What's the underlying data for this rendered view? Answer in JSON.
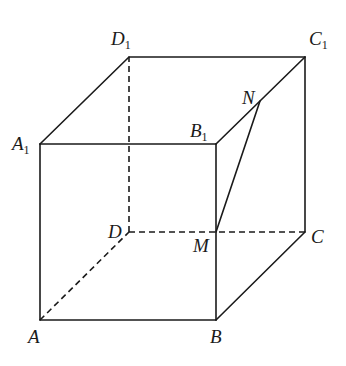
{
  "figure": {
    "type": "cube-perspective",
    "stroke_color": "#1a1a1a",
    "background": "#ffffff"
  },
  "vertices": {
    "A": {
      "name": "A",
      "sub": "",
      "x": 40,
      "y": 320
    },
    "B": {
      "name": "B",
      "sub": "",
      "x": 216,
      "y": 320
    },
    "C": {
      "name": "C",
      "sub": "",
      "x": 305,
      "y": 232
    },
    "D": {
      "name": "D",
      "sub": "",
      "x": 129,
      "y": 232
    },
    "A1": {
      "name": "A",
      "sub": "1",
      "x": 40,
      "y": 144
    },
    "B1": {
      "name": "B",
      "sub": "1",
      "x": 216,
      "y": 144
    },
    "C1": {
      "name": "C",
      "sub": "1",
      "x": 305,
      "y": 57
    },
    "D1": {
      "name": "D",
      "sub": "1",
      "x": 129,
      "y": 57
    },
    "M": {
      "name": "M",
      "sub": "",
      "x": 216,
      "y": 232
    },
    "N": {
      "name": "N",
      "sub": "",
      "x": 260,
      "y": 101
    }
  },
  "edges": {
    "solid": [
      "A-B",
      "B-C",
      "C-C1",
      "C1-D1",
      "D1-A1",
      "A1-A",
      "A1-B1",
      "B1-C1",
      "B1-B",
      "M-N"
    ],
    "dashed": [
      "A-D",
      "D-C",
      "D-D1"
    ]
  },
  "labels": {
    "A": {
      "text": "A",
      "sub": ""
    },
    "B": {
      "text": "B",
      "sub": ""
    },
    "C": {
      "text": "C",
      "sub": ""
    },
    "D": {
      "text": "D",
      "sub": ""
    },
    "A1": {
      "text": "A",
      "sub": "1"
    },
    "B1": {
      "text": "B",
      "sub": "1"
    },
    "C1": {
      "text": "C",
      "sub": "1"
    },
    "D1": {
      "text": "D",
      "sub": "1"
    },
    "M": {
      "text": "M",
      "sub": ""
    },
    "N": {
      "text": "N",
      "sub": ""
    }
  }
}
